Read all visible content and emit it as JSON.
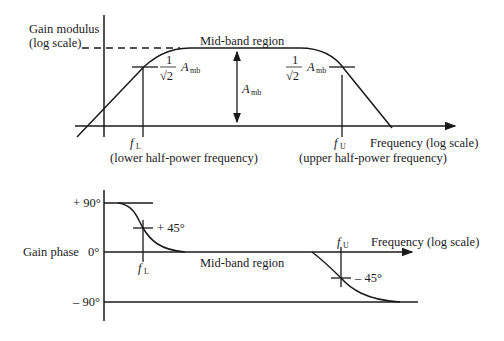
{
  "magnitude_plot": {
    "y_label_line1": "Gain modulus",
    "y_label_line2": "(log scale)",
    "x_label": "Frequency (log scale)",
    "region_label": "Mid-band region",
    "half_power_frac_num": "1",
    "half_power_frac_den": "√2",
    "amb_symbol": "A",
    "amb_sub": "mb",
    "fL_symbol": "f",
    "fL_sub": "L",
    "fU_symbol": "f",
    "fU_sub": "U",
    "fL_caption": "(lower half-power frequency)",
    "fU_caption": "(upper half-power frequency)"
  },
  "phase_plot": {
    "y_label": "Gain phase",
    "tick_plus90": "+ 90°",
    "tick_zero": "0°",
    "tick_minus90": "– 90°",
    "x_label": "Frequency (log scale)",
    "region_label": "Mid-band region",
    "plus45_label": "+ 45°",
    "minus45_label": "– 45°",
    "fL_symbol": "f",
    "fL_sub": "L",
    "fU_symbol": "f",
    "fU_sub": "U"
  }
}
